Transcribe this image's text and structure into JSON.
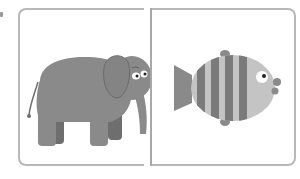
{
  "panels": [
    {
      "id": "left",
      "subject": "elephant",
      "icon": "elephant-icon"
    },
    {
      "id": "right",
      "subject": "fish",
      "icon": "fish-icon"
    }
  ],
  "colors": {
    "border": "#b8b8b8",
    "divider": "#a8a8a8",
    "body_gray": "#8a8a8a",
    "dark_gray": "#6e6e6e",
    "light_gray": "#c4c4c4",
    "background": "#ffffff"
  }
}
